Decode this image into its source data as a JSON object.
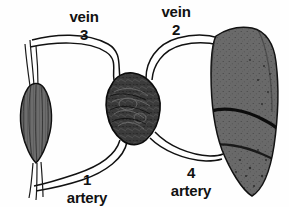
{
  "figure": {
    "type": "anatomical-diagram",
    "background_color": "#fefefe",
    "line_color": "#111111"
  },
  "labels": {
    "vein3": {
      "name": "vein",
      "number": "3"
    },
    "vein2": {
      "name": "vein",
      "number": "2"
    },
    "artery1": {
      "name": "artery",
      "number": "1"
    },
    "artery4": {
      "name": "artery",
      "number": "4"
    }
  },
  "organs": {
    "left": {
      "name": "muscle-organ",
      "fill": "#6d6d6d",
      "outline": "#111111",
      "description": "elongated spindle-shaped striated organ"
    },
    "center": {
      "name": "heart",
      "fill": "#3b3b3b",
      "outline": "#0d0d0d",
      "description": "dark textured heart"
    },
    "right": {
      "name": "lung-organ",
      "fill": "#6a6a6a",
      "outline": "#121212",
      "description": "large lobed speckled organ"
    }
  },
  "vessels": {
    "vein3": {
      "label_ref": "3",
      "from": "muscle-organ",
      "to": "heart",
      "position": "upper-left"
    },
    "vein2": {
      "label_ref": "2",
      "from": "heart",
      "to": "lung-organ",
      "position": "upper-right"
    },
    "artery1": {
      "label_ref": "1",
      "from": "heart",
      "to": "muscle-organ",
      "position": "lower-left"
    },
    "artery4": {
      "label_ref": "4",
      "from": "lung-organ",
      "to": "heart",
      "position": "lower-right"
    }
  }
}
